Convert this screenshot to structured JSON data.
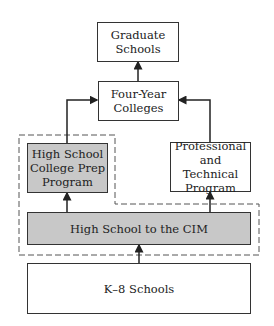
{
  "diagram": {
    "nodes": {
      "graduate": "Graduate Schools",
      "four_year": "Four-Year Colleges",
      "hs_prep": "High School College Prep Program",
      "prof_tech": "Professional and Technical Program",
      "hs_cim": "High School to the CIM",
      "k8": "K–8 Schools"
    },
    "lines": {
      "graduate": [
        "Graduate",
        "Schools"
      ],
      "four_year": [
        "Four-Year",
        "Colleges"
      ],
      "hs_prep": [
        "High School",
        "College Prep",
        "Program"
      ],
      "prof_tech": [
        "Professional",
        "and Technical",
        "Program"
      ]
    },
    "edges": [
      {
        "from": "k8",
        "to": "hs_cim"
      },
      {
        "from": "hs_cim",
        "to": "hs_prep"
      },
      {
        "from": "hs_cim",
        "to": "prof_tech"
      },
      {
        "from": "hs_prep",
        "to": "four_year"
      },
      {
        "from": "prof_tech",
        "to": "four_year"
      },
      {
        "from": "four_year",
        "to": "graduate"
      }
    ],
    "colors": {
      "highlight_fill": "#c8c8c8",
      "stroke": "#333333"
    }
  }
}
